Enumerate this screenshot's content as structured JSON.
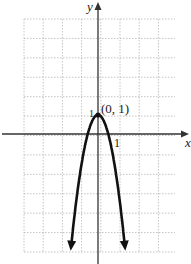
{
  "chart_data": {
    "type": "line",
    "title": "",
    "xlabel": "x",
    "ylabel": "y",
    "point_label": "(0, 1)",
    "x_tick_label": "1",
    "y_tick_label": "1",
    "xlim": [
      -4,
      4
    ],
    "ylim": [
      -6,
      6
    ],
    "grid": true,
    "series": [
      {
        "name": "parabola",
        "x": [
          -1.4,
          -1.2,
          -1.0,
          -0.8,
          -0.6,
          -0.4,
          -0.2,
          0,
          0.2,
          0.4,
          0.6,
          0.8,
          1.0,
          1.2,
          1.4
        ],
        "y": [
          -5.9,
          -4.6,
          -3.4,
          -2.3,
          -1.4,
          -0.6,
          0.6,
          1,
          0.6,
          -0.6,
          -1.4,
          -2.3,
          -3.4,
          -4.6,
          -5.9
        ]
      }
    ],
    "annotations": [
      {
        "x": 0,
        "y": 1,
        "text": "(0, 1)"
      }
    ]
  },
  "colors": {
    "curve": "#111111",
    "axis": "#333333",
    "grid": "#aaaaaa"
  }
}
